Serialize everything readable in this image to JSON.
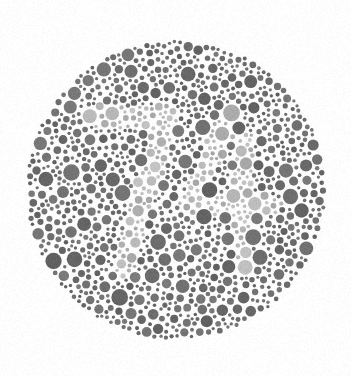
{
  "page": {
    "background_color": "#ffffff",
    "width": 351,
    "height": 376,
    "title": "Ishihara Color Vision Test Plate"
  },
  "plate": {
    "name": "ishihara-plate",
    "shape": "circle",
    "center_x": 176,
    "center_y": 190,
    "radius": 151,
    "field_color": "#ffffff",
    "dot_gap": 1.1,
    "min_dot_radius": 1.6,
    "max_dot_radius": 8.4,
    "total_dots_approx": 1080,
    "hidden_figure": "74",
    "figure_visible_to": "normal color vision",
    "colors": {
      "background_dark_dot": "#6f6f6f",
      "background_dark_dot_alt": "#767676",
      "background_dark_dot_alt2": "#656565",
      "figure_light_dot": "#b6b6b6",
      "figure_light_dot_alt": "#c0c0c0",
      "figure_light_dot_alt2": "#aaaaaa",
      "plate_background": "#fdfdfd",
      "page_background": "#ffffff"
    },
    "noise": {
      "tone_jitter": 10,
      "seed": 20240617
    }
  },
  "figure_strokes": [
    {
      "glyph": "7",
      "segments": [
        {
          "type": "line",
          "x1": 97,
          "y1": 117,
          "x2": 168,
          "y2": 117,
          "width": 22
        },
        {
          "type": "line",
          "x1": 168,
          "y1": 117,
          "x2": 124,
          "y2": 268,
          "width": 22
        }
      ]
    },
    {
      "glyph": "4",
      "segments": [
        {
          "type": "line",
          "x1": 232,
          "y1": 113,
          "x2": 190,
          "y2": 205,
          "width": 21
        },
        {
          "type": "line",
          "x1": 190,
          "y1": 205,
          "x2": 272,
          "y2": 205,
          "width": 21
        },
        {
          "type": "line",
          "x1": 243,
          "y1": 140,
          "x2": 243,
          "y2": 268,
          "width": 21
        }
      ]
    }
  ]
}
